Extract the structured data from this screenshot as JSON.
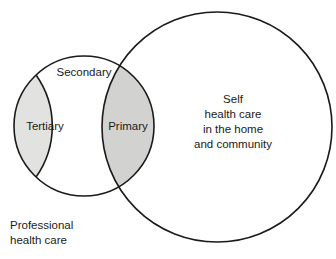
{
  "diagram": {
    "colors": {
      "stroke": "#1a1a1a",
      "background": "#ffffff",
      "tertiary_fill": "#e2e2e0",
      "primary_fill": "#d2d2d0",
      "text": "#1a1a1a"
    },
    "circles": {
      "professional": {
        "cx": 84,
        "cy": 126,
        "r": 70
      },
      "self_care": {
        "cx": 217,
        "cy": 127,
        "r": 115
      }
    },
    "regions": [
      {
        "id": "tertiary",
        "label": "Tertiary",
        "shaded": true,
        "label_x": 45,
        "label_y": 127
      },
      {
        "id": "secondary",
        "label": "Secondary",
        "shaded": false,
        "label_x": 84,
        "label_y": 73
      },
      {
        "id": "primary",
        "label": "Primary",
        "shaded": true,
        "label_x": 128,
        "label_y": 127
      }
    ],
    "self_care_lines": [
      "Self",
      "health care",
      "in the home",
      "and community"
    ],
    "self_care_label_x": 233,
    "self_care_label_y": 100,
    "self_care_line_height": 15,
    "caption_lines": [
      "Professional",
      "health care"
    ],
    "caption_x": 10,
    "caption_y": 226,
    "caption_line_height": 15
  }
}
